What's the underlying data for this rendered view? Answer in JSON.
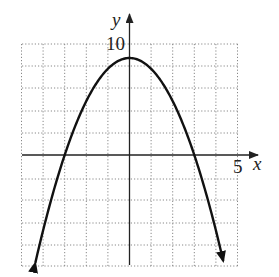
{
  "chart_data": {
    "type": "line",
    "title": "",
    "function": "y = 9 - x^2",
    "xlabel": "x",
    "ylabel": "y",
    "xlim": [
      -5,
      5
    ],
    "ylim": [
      -10,
      10
    ],
    "x_tick_step": 1,
    "y_tick_step": 2,
    "grid": true,
    "labeled_ticks": {
      "x": [
        "5"
      ],
      "y": [
        "10"
      ]
    },
    "series": [
      {
        "name": "parabola",
        "x": [
          -4.36,
          -4,
          -3,
          -2,
          -1,
          0,
          1,
          2,
          3,
          4,
          4.36
        ],
        "y": [
          -10,
          -7,
          0,
          5,
          8,
          9,
          8,
          5,
          0,
          -7,
          -10
        ],
        "arrows_at_ends": true
      }
    ],
    "vertex": [
      0,
      9
    ],
    "x_intercepts": [
      -3,
      3
    ],
    "colors": {
      "curve": "#111111",
      "grid": "#888888",
      "axes": "#222222"
    }
  },
  "labels": {
    "x_axis": "x",
    "y_axis": "y",
    "x_tick": "5",
    "y_tick": "10"
  }
}
